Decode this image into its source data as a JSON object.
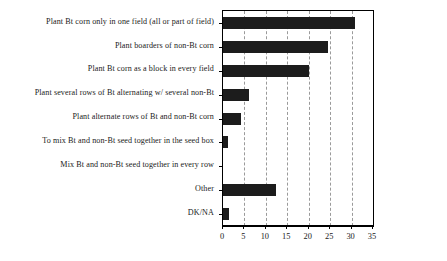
{
  "chart_data": {
    "type": "bar",
    "orientation": "horizontal",
    "title": "",
    "subtitle": "",
    "xlabel": "",
    "ylabel": "",
    "xlim": [
      0,
      35
    ],
    "xticks": [
      0,
      5,
      10,
      15,
      20,
      25,
      30,
      35
    ],
    "xtick_labels": [
      "0",
      "5",
      "10",
      "15",
      "20",
      "25",
      "30",
      "35"
    ],
    "grid": true,
    "grid_axis": "x",
    "grid_style": "dashed",
    "legend": false,
    "legend_position": "none",
    "bar_color": "#1c1c1c",
    "categories": [
      "Plant Bt corn only in one field (all or part of field)",
      "Plant boarders of non-Bt corn",
      "Plant Bt corn as a block in every field",
      "Plant several rows of Bt alternating w/ several non-Bt",
      "Plant alternate rows of Bt and non-Bt corn",
      "To mix Bt and non-Bt seed together in the seed box",
      "Mix Bt and non-Bt seed together in every row",
      "Other",
      "DK/NA"
    ],
    "values": [
      30.8,
      24.6,
      20.1,
      6.0,
      4.2,
      1.1,
      0,
      12.4,
      1.3
    ]
  }
}
